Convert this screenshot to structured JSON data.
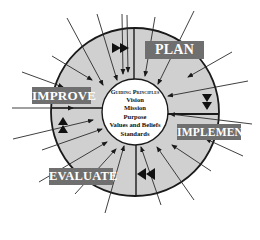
{
  "diagram": {
    "phases": [
      {
        "id": "plan",
        "label": "PLAN"
      },
      {
        "id": "implement",
        "label": "IMPLEMENT"
      },
      {
        "id": "evaluate",
        "label": "EVALUATE"
      },
      {
        "id": "improve",
        "label": "IMPROVE"
      }
    ],
    "center": {
      "title": "Guiding Principles",
      "items": [
        "Vision",
        "Mission",
        "Purpose",
        "Values and Beliefs",
        "Standards"
      ]
    },
    "flow_markers": [
      {
        "quadrant": "top",
        "direction": "right",
        "count": 2
      },
      {
        "quadrant": "right",
        "direction": "down",
        "count": 2
      },
      {
        "quadrant": "bottom",
        "direction": "left",
        "count": 2
      },
      {
        "quadrant": "left",
        "direction": "up",
        "count": 2
      }
    ],
    "colors": {
      "ring_fill": "#d0d0d0",
      "label_box": "#6f6f6f",
      "label_text": "#ffffff",
      "outline": "#1a1a1a"
    }
  }
}
